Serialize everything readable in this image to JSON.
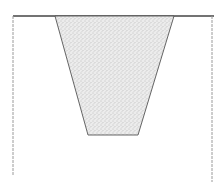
{
  "diagram": {
    "type": "cross-section",
    "colors": {
      "background": "#ffffff",
      "line": "#555555",
      "top_edge": "#444444",
      "wall": "#9a9a9a",
      "fill": "#e6e6e6",
      "stipple": "#8c8c8c"
    },
    "top_surface": {
      "x1": 13,
      "x2": 214,
      "y": 16
    },
    "left_wall": {
      "x": 13,
      "y1": 16,
      "y2": 176
    },
    "right_wall": {
      "x": 212,
      "y1": 16,
      "y2": 182
    },
    "trench": {
      "points": [
        [
          55,
          16
        ],
        [
          174,
          16
        ],
        [
          138,
          135
        ],
        [
          88,
          135
        ]
      ],
      "fill_pattern": "stipple"
    }
  }
}
